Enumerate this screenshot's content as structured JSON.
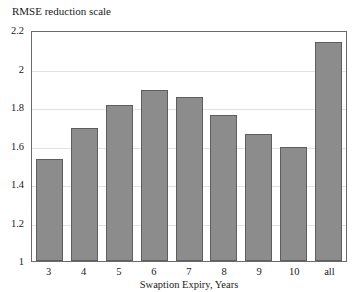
{
  "chart_data": {
    "type": "bar",
    "title": "RMSE reduction scale",
    "xlabel": "Swaption Expiry, Years",
    "ylabel": "",
    "categories": [
      "3",
      "4",
      "5",
      "6",
      "7",
      "8",
      "9",
      "10",
      "all"
    ],
    "values": [
      1.53,
      1.69,
      1.81,
      1.89,
      1.85,
      1.76,
      1.66,
      1.59,
      2.14
    ],
    "ylim": [
      1,
      2.2
    ],
    "yticks": [
      "1",
      "1.2",
      "1.4",
      "1.6",
      "1.8",
      "2",
      "2.2"
    ],
    "ytick_values": [
      1,
      1.2,
      1.4,
      1.6,
      1.8,
      2,
      2.2
    ],
    "grid": true,
    "legend": null,
    "series": [
      {
        "name": "RMSE reduction scale",
        "values": [
          1.53,
          1.69,
          1.81,
          1.89,
          1.85,
          1.76,
          1.66,
          1.59,
          2.14
        ]
      }
    ],
    "colors": {
      "bar_fill": "#8c8c8c",
      "bar_border": "#5e5e5e",
      "gridline": "#e2e2e2",
      "frame": "#6b6b6b",
      "text": "#1a1a1a",
      "background": "#ffffff"
    }
  }
}
